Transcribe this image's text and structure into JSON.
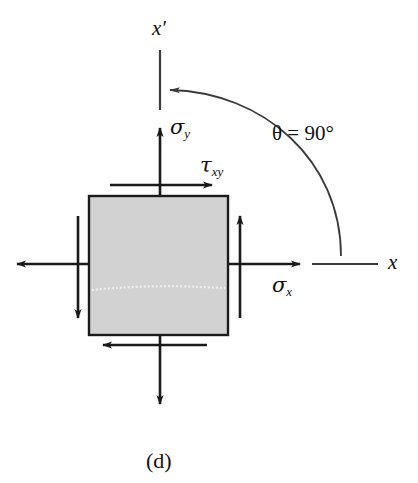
{
  "figure": {
    "caption": "(d)",
    "axes": {
      "x_prime_label": "x′",
      "x_label": "x"
    },
    "stresses": {
      "sigma_y_symbol": "σ",
      "sigma_y_subscript": "y",
      "sigma_x_symbol": "σ",
      "sigma_x_subscript": "x",
      "tau_symbol": "τ",
      "tau_subscript": "xy"
    },
    "angle": {
      "symbol": "θ",
      "equals": "=",
      "value": "90°",
      "full_text": "θ = 90°"
    },
    "element": {
      "fill_color": "#d2d2d2",
      "stroke_color": "#1a1a1a",
      "x": 89,
      "y": 196,
      "width": 139,
      "height": 139
    },
    "colors": {
      "ink": "#1a1a1a",
      "arc": "#3a3a3a",
      "background": "#ffffff"
    }
  }
}
